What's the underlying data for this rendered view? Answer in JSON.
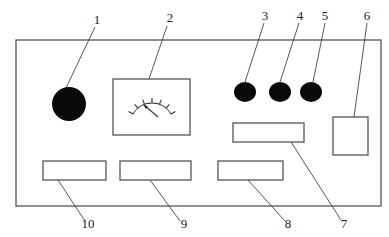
{
  "diagram": {
    "type": "panel-layout",
    "panel": {
      "x": 16,
      "y": 40,
      "w": 365,
      "h": 166
    },
    "components": [
      {
        "id": "1",
        "label": "1",
        "shape": "filled-circle",
        "cx": 69,
        "cy": 104,
        "r": 17,
        "label_pos": [
          97,
          24
        ],
        "leader": [
          [
            95,
            27
          ],
          [
            66,
            88
          ]
        ]
      },
      {
        "id": "2",
        "label": "2",
        "shape": "meter-box",
        "x": 113,
        "y": 79,
        "w": 77,
        "h": 56,
        "label_pos": [
          170,
          22
        ],
        "leader": [
          [
            167,
            26
          ],
          [
            149,
            79
          ]
        ]
      },
      {
        "id": "3",
        "label": "3",
        "shape": "filled-ellipse",
        "cx": 245,
        "cy": 92,
        "rx": 11,
        "ry": 10,
        "label_pos": [
          265,
          20
        ],
        "leader": [
          [
            264,
            23
          ],
          [
            245,
            82
          ]
        ]
      },
      {
        "id": "4",
        "label": "4",
        "shape": "filled-ellipse",
        "cx": 280,
        "cy": 92,
        "rx": 11,
        "ry": 10,
        "label_pos": [
          300,
          20
        ],
        "leader": [
          [
            299,
            23
          ],
          [
            280,
            82
          ]
        ]
      },
      {
        "id": "5",
        "label": "5",
        "shape": "filled-ellipse",
        "cx": 311,
        "cy": 92,
        "rx": 11,
        "ry": 10,
        "label_pos": [
          325,
          20
        ],
        "leader": [
          [
            325,
            23
          ],
          [
            313,
            82
          ]
        ]
      },
      {
        "id": "6",
        "label": "6",
        "shape": "rect",
        "x": 333,
        "y": 117,
        "w": 35,
        "h": 38,
        "label_pos": [
          367,
          20
        ],
        "leader": [
          [
            367,
            23
          ],
          [
            354,
            117
          ]
        ]
      },
      {
        "id": "7",
        "label": "7",
        "shape": "rect",
        "x": 233,
        "y": 123,
        "w": 71,
        "h": 19,
        "label_pos": [
          344,
          228
        ],
        "leader": [
          [
            341,
            220
          ],
          [
            291,
            142
          ]
        ]
      },
      {
        "id": "8",
        "label": "8",
        "shape": "rect",
        "x": 218,
        "y": 161,
        "w": 65,
        "h": 19,
        "label_pos": [
          288,
          228
        ],
        "leader": [
          [
            285,
            221
          ],
          [
            248,
            180
          ]
        ]
      },
      {
        "id": "9",
        "label": "9",
        "shape": "rect",
        "x": 120,
        "y": 161,
        "w": 71,
        "h": 19,
        "label_pos": [
          184,
          228
        ],
        "leader": [
          [
            180,
            221
          ],
          [
            150,
            180
          ]
        ]
      },
      {
        "id": "10",
        "label": "10",
        "shape": "rect",
        "x": 43,
        "y": 161,
        "w": 63,
        "h": 19,
        "label_pos": [
          88,
          228
        ],
        "leader": [
          [
            85,
            221
          ],
          [
            58,
            180
          ]
        ]
      }
    ],
    "meter": {
      "center": [
        152,
        125
      ],
      "radius_inner": 22,
      "radius_outer": 27,
      "tick_count": 7,
      "arc_start_deg": -150,
      "arc_end_deg": -30,
      "needle": {
        "from": [
          158,
          117
        ],
        "to": [
          144,
          105
        ]
      }
    },
    "colors": {
      "stroke": "#555555",
      "fill": "#0a0a0a",
      "background": "#ffffff",
      "text": "#222222"
    }
  }
}
